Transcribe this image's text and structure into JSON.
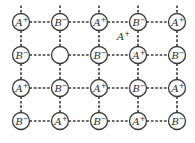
{
  "diagram": {
    "title": "",
    "type": "ionic crystal lattice with Frenkel-type defect (vacancy and interstitial)",
    "colors": {
      "stroke": "#3a3a3a",
      "text": "#2a2a2a",
      "background": "#ffffff"
    },
    "grid": {
      "columns_x": [
        21,
        60,
        99,
        138,
        177
      ],
      "rows_y": [
        22,
        55,
        88,
        121
      ],
      "radius": 8.5
    },
    "rows": [
      [
        "A+",
        "B-",
        "A+",
        "B-",
        "A+"
      ],
      [
        "B-",
        "",
        "B-",
        "A+",
        "B-"
      ],
      [
        "A+",
        "B-",
        "A+",
        "B-",
        "A+"
      ],
      [
        "B-",
        "A+",
        "B-",
        "A+",
        "B-"
      ]
    ],
    "nodes": [
      {
        "row": 0,
        "col": 0,
        "base": "A",
        "charge": "+"
      },
      {
        "row": 0,
        "col": 1,
        "base": "B",
        "charge": "−"
      },
      {
        "row": 0,
        "col": 2,
        "base": "A",
        "charge": "+"
      },
      {
        "row": 0,
        "col": 3,
        "base": "B",
        "charge": "−"
      },
      {
        "row": 0,
        "col": 4,
        "base": "A",
        "charge": "+"
      },
      {
        "row": 1,
        "col": 0,
        "base": "B",
        "charge": "−"
      },
      {
        "row": 1,
        "col": 1,
        "base": "",
        "charge": "",
        "vacancy": true
      },
      {
        "row": 1,
        "col": 2,
        "base": "B",
        "charge": "−"
      },
      {
        "row": 1,
        "col": 3,
        "base": "A",
        "charge": "+"
      },
      {
        "row": 1,
        "col": 4,
        "base": "B",
        "charge": "−"
      },
      {
        "row": 2,
        "col": 0,
        "base": "A",
        "charge": "+"
      },
      {
        "row": 2,
        "col": 1,
        "base": "B",
        "charge": "−"
      },
      {
        "row": 2,
        "col": 2,
        "base": "A",
        "charge": "+"
      },
      {
        "row": 2,
        "col": 3,
        "base": "B",
        "charge": "−"
      },
      {
        "row": 2,
        "col": 4,
        "base": "A",
        "charge": "+"
      },
      {
        "row": 3,
        "col": 0,
        "base": "B",
        "charge": "−"
      },
      {
        "row": 3,
        "col": 1,
        "base": "A",
        "charge": "+"
      },
      {
        "row": 3,
        "col": 2,
        "base": "B",
        "charge": "−"
      },
      {
        "row": 3,
        "col": 3,
        "base": "A",
        "charge": "+"
      },
      {
        "row": 3,
        "col": 4,
        "base": "B",
        "charge": "−"
      }
    ],
    "interstitial": {
      "base": "A",
      "charge": "+",
      "x": 117,
      "y": 40
    }
  }
}
